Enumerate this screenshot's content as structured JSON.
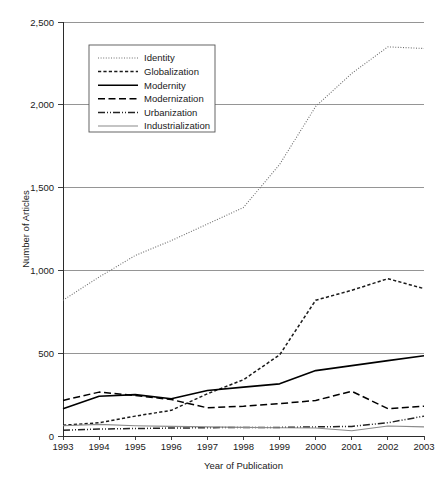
{
  "figure": {
    "background": "#ffffff",
    "ink_color": "#1a1a1a",
    "grid_color": "#8a8a8a"
  },
  "axes": {
    "x_title": "Year of Publication",
    "y_title": "Number of Articles",
    "x_tick_labels": [
      "1993",
      "1994",
      "1995",
      "1996",
      "1997",
      "1998",
      "1999",
      "2000",
      "2001",
      "2002",
      "2003"
    ],
    "y_tick_labels": [
      "0",
      "500",
      "1,000",
      "1,500",
      "2,000",
      "2,500"
    ]
  },
  "legend": {
    "position": "top-left-inside",
    "items": [
      {
        "label": "Identity",
        "style": "dotted-fine",
        "color": "#6e6e6e"
      },
      {
        "label": "Globalization",
        "style": "dashed-short",
        "color": "#1a1a1a"
      },
      {
        "label": "Modernity",
        "style": "solid-thick",
        "color": "#000000"
      },
      {
        "label": "Modernization",
        "style": "dashed-long",
        "color": "#000000"
      },
      {
        "label": "Urbanization",
        "style": "dash-dot-dot",
        "color": "#222222"
      },
      {
        "label": "Industrialization",
        "style": "solid-thin",
        "color": "#8a8a8a"
      }
    ]
  },
  "chart_data": {
    "type": "line",
    "title": "",
    "xlabel": "Year of Publication",
    "ylabel": "Number of Articles",
    "x": [
      1993,
      1994,
      1995,
      1996,
      1997,
      1998,
      1999,
      2000,
      2001,
      2002,
      2003
    ],
    "categories": [
      "1993",
      "1994",
      "1995",
      "1996",
      "1997",
      "1998",
      "1999",
      "2000",
      "2001",
      "2002",
      "2003"
    ],
    "xlim": [
      1993,
      2003
    ],
    "ylim": [
      0,
      2500
    ],
    "y_ticks": [
      0,
      500,
      1000,
      1500,
      2000,
      2500
    ],
    "grid": "horizontal",
    "legend_position": "upper left inside",
    "series": [
      {
        "name": "Identity",
        "style": "dotted-fine",
        "color": "#6e6e6e",
        "values": [
          820,
          960,
          1090,
          1180,
          1280,
          1380,
          1640,
          1990,
          2190,
          2350,
          2340
        ]
      },
      {
        "name": "Globalization",
        "style": "dashed-short",
        "color": "#1a1a1a",
        "values": [
          65,
          80,
          120,
          155,
          255,
          340,
          490,
          820,
          880,
          950,
          890
        ]
      },
      {
        "name": "Modernity",
        "style": "solid-thick",
        "color": "#000000",
        "values": [
          165,
          240,
          250,
          225,
          275,
          295,
          315,
          395,
          425,
          455,
          485
        ]
      },
      {
        "name": "Modernization",
        "style": "dashed-long",
        "color": "#000000",
        "values": [
          215,
          265,
          245,
          220,
          170,
          180,
          195,
          215,
          270,
          165,
          180
        ]
      },
      {
        "name": "Urbanization",
        "style": "dash-dot-dot",
        "color": "#222222",
        "values": [
          35,
          42,
          45,
          48,
          50,
          52,
          52,
          55,
          58,
          80,
          120
        ]
      },
      {
        "name": "Industrialization",
        "style": "solid-thin",
        "color": "#8a8a8a",
        "values": [
          62,
          70,
          62,
          58,
          55,
          52,
          50,
          48,
          32,
          60,
          55
        ]
      }
    ]
  }
}
